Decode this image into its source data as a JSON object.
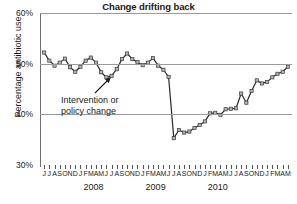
{
  "chart_data": {
    "type": "line",
    "title": "Change drifting back",
    "xlabel": "",
    "ylabel": "Percentage antibiotic use",
    "ylim": [
      30,
      60
    ],
    "yticks": [
      30,
      40,
      50,
      60
    ],
    "ytick_labels": [
      "30%",
      "40%",
      "50%",
      "60%"
    ],
    "grid": true,
    "legend": "none",
    "x": [
      "J",
      "J",
      "A",
      "S",
      "O",
      "N",
      "D",
      "J",
      "F",
      "M",
      "A",
      "M",
      "J",
      "J",
      "A",
      "S",
      "O",
      "N",
      "D",
      "J",
      "F",
      "M",
      "A",
      "M",
      "J",
      "J",
      "A",
      "S",
      "O",
      "N",
      "D",
      "J",
      "F",
      "M",
      "A",
      "M"
    ],
    "year_labels": [
      "2008",
      "2009",
      "2010"
    ],
    "year_label_index": [
      12,
      24,
      36
    ],
    "values": [
      52.2,
      50.6,
      49.6,
      50.2,
      51.0,
      49.3,
      48.4,
      49.4,
      50.6,
      51.2,
      50.2,
      48.3,
      47.3,
      47.6,
      48.9,
      50.9,
      52.0,
      50.9,
      50.3,
      49.7,
      50.2,
      51.1,
      49.6,
      48.8,
      47.4,
      35.3,
      36.9,
      36.4,
      36.6,
      37.3,
      37.9,
      38.6,
      40.2,
      40.3,
      39.9,
      41.0
    ],
    "values_tail": [
      41.1,
      41.2,
      44.1,
      42.3,
      44.6,
      46.7,
      46.1,
      46.4,
      47.3,
      48.0,
      48.4,
      49.4
    ],
    "annotations": [
      {
        "name": "intervention-annotation",
        "line1": "Intervention or",
        "line2": "policy change",
        "arrow": "up-right"
      }
    ],
    "series_color": "#2b2b2b",
    "marker_fill": "#b3b3b3",
    "marker_stroke": "#3a3a3a",
    "grid_color": "#9a9a9a"
  }
}
